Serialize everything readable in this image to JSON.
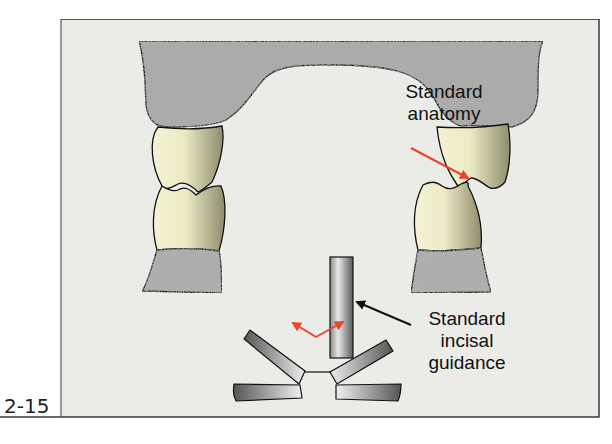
{
  "figure": {
    "number": "2-15",
    "labels": {
      "anatomy_line1": "Standard",
      "anatomy_line2": "anatomy",
      "guidance_line1": "Standard",
      "guidance_line2": "incisal",
      "guidance_line3": "guidance"
    },
    "colors": {
      "panel_bg": "#ebebe8",
      "frame": "#3a3a3a",
      "tooth_light": "#f2f0cf",
      "tooth_dark": "#8f8d6c",
      "bone": "#a9a9a9",
      "arrow_red": "#e8452a",
      "arrow_black": "#111111",
      "guide_metal_light": "#e6e6e6",
      "guide_metal_dark": "#555555"
    },
    "elements": [
      "maxillary-bone-arch",
      "left-upper-tooth",
      "left-lower-tooth",
      "left-mandibular-bone",
      "right-upper-tooth",
      "right-lower-tooth",
      "right-mandibular-bone",
      "incisal-guide-pin",
      "incisal-guide-table",
      "red-movement-arrows",
      "anatomy-pointer-arrow",
      "guidance-pointer-arrow"
    ]
  }
}
